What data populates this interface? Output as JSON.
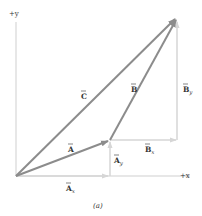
{
  "axes": {
    "y_label": "+y",
    "x_label": "+x"
  },
  "vectors": {
    "A": {
      "label": "A",
      "color": "#8c8c8c"
    },
    "B": {
      "label": "B",
      "color": "#8c8c8c"
    },
    "C": {
      "label": "C",
      "color": "#8c8c8c"
    },
    "Ax": {
      "label": "A",
      "sub": "x",
      "color": "#d9d9d9"
    },
    "Ay": {
      "label": "A",
      "sub": "y",
      "color": "#d9d9d9"
    },
    "Bx": {
      "label": "B",
      "sub": "x",
      "color": "#d9d9d9"
    },
    "By": {
      "label": "B",
      "sub": "y",
      "color": "#d9d9d9"
    }
  },
  "caption": "(a)"
}
